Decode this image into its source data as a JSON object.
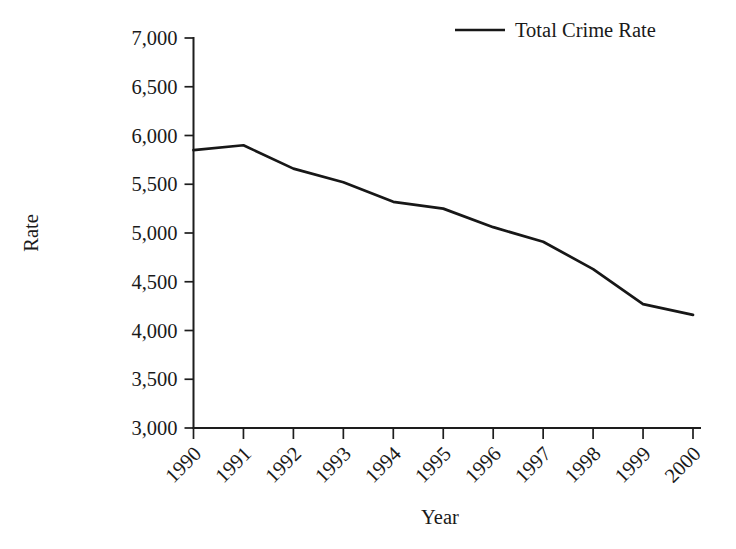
{
  "chart_data": {
    "type": "line",
    "title": "",
    "xlabel": "Year",
    "ylabel": "Rate",
    "categories": [
      "1990",
      "1991",
      "1992",
      "1993",
      "1994",
      "1995",
      "1996",
      "1997",
      "1998",
      "1999",
      "2000"
    ],
    "series": [
      {
        "name": "Total Crime Rate",
        "color": "#171717",
        "values": [
          5850,
          5900,
          5660,
          5520,
          5320,
          5250,
          5060,
          4910,
          4630,
          4270,
          4160
        ]
      }
    ],
    "ylim": [
      3000,
      7000
    ],
    "ytick_values": [
      3000,
      3500,
      4000,
      4500,
      5000,
      5500,
      6000,
      6500,
      7000
    ],
    "ytick_labels": [
      "3,000",
      "3,500",
      "4,000",
      "4,500",
      "5,000",
      "5,500",
      "6,000",
      "6,500",
      "7,000"
    ],
    "xtick_labels": [
      "1990",
      "1991",
      "1992",
      "1993",
      "1994",
      "1995",
      "1996",
      "1997",
      "1998",
      "1999",
      "2000"
    ],
    "xtick_rotation_degrees": 45,
    "grid": false,
    "legend_position": "top-right",
    "legend_entries": [
      "Total Crime Rate"
    ]
  },
  "axes": {
    "y_title": "Rate",
    "x_title": "Year"
  },
  "legend": {
    "items": [
      {
        "label": "Total Crime Rate"
      }
    ]
  }
}
